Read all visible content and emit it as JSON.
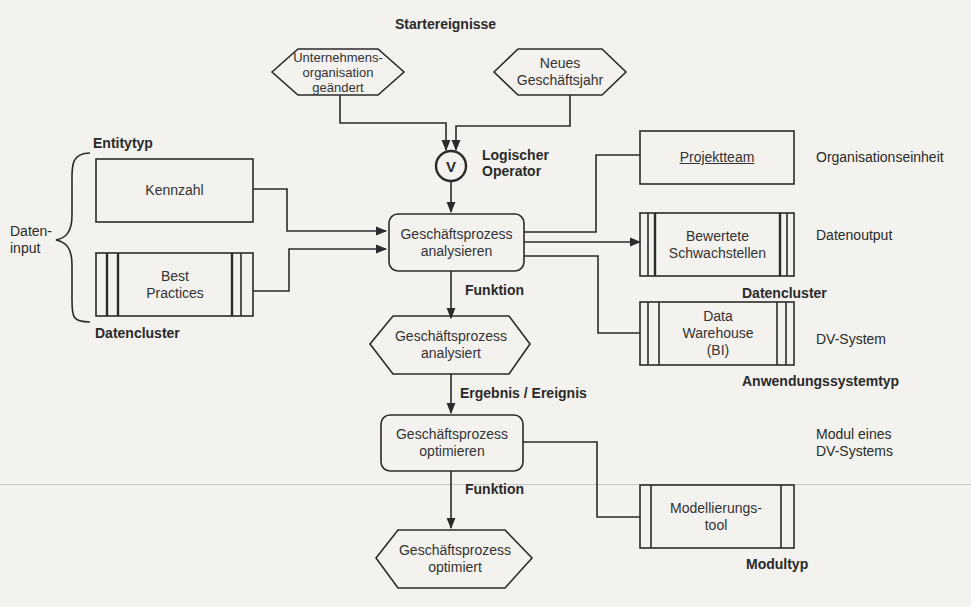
{
  "diagram": {
    "type": "EPK (Ereignisgesteuerte Prozesskette)",
    "start_events_label": "Startereignisse",
    "start_events": [
      {
        "id": "ev-org",
        "text": "Unternehmens-\norganisation\ngeändert"
      },
      {
        "id": "ev-year",
        "text": "Neues\nGeschäftsjahr"
      }
    ],
    "operator": {
      "symbol": "V",
      "label_line1": "Logischer",
      "label_line2": "Operator"
    },
    "left": {
      "entitytyp_label": "Entitytyp",
      "kennzahl": "Kennzahl",
      "best_practices": "Best\nPractices",
      "datencluster_label": "Datencluster",
      "brace_label": "Daten-\ninput"
    },
    "center": {
      "function1": "Geschäftsprozess\nanalysieren",
      "function1_label": "Funktion",
      "event1": "Geschäftsprozess\nanalysiert",
      "event1_label": "Ergebnis / Ereignis",
      "function2": "Geschäftsprozess\noptimieren",
      "function2_label": "Funktion",
      "event2": "Geschäftsprozess\noptimiert"
    },
    "right": {
      "projektteam": "Projektteam",
      "projektteam_type": "Organisationseinheit",
      "schwachstellen": "Bewertete\nSchwachstellen",
      "schwachstellen_type": "Datenoutput",
      "datencluster_label": "Datencluster",
      "datawarehouse": "Data\nWarehouse\n(BI)",
      "datawarehouse_type": "DV-System",
      "anwendungssystemtyp_label": "Anwendungssystemtyp",
      "modul_desc": "Modul eines\nDV-Systems",
      "modellierungstool": "Modellierungs-\ntool",
      "modultyp_label": "Modultyp"
    },
    "colors": {
      "stroke": "#2b2b2b",
      "background": "#f3f2ee"
    }
  }
}
